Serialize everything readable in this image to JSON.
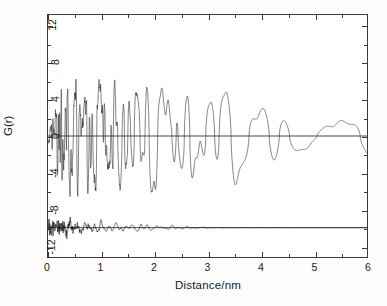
{
  "chart_data": {
    "type": "line",
    "title": "",
    "subtitle": "",
    "xlabel": "Distance/nm",
    "ylabel": "G(r)",
    "xlim": [
      0,
      6
    ],
    "ylim": [
      -13.2,
      13.2
    ],
    "xticks": [
      0,
      1,
      2,
      3,
      4,
      5,
      6
    ],
    "xticklabels": [
      "0",
      "1",
      "2",
      "3",
      "4",
      "5",
      "6"
    ],
    "xminor_step": 0.5,
    "yticks": [
      -12,
      -8,
      -4,
      0,
      4,
      8,
      12
    ],
    "yticklabels": [
      "-12",
      "-8",
      "-4",
      "0",
      "4",
      "8",
      "12"
    ],
    "yminor_step": 2,
    "grid": false,
    "legend": null,
    "annotations": [],
    "reference_lines": [
      {
        "name": "zero-line",
        "y": 0,
        "color": "#1a1a1a"
      },
      {
        "name": "difference-offset-line",
        "y": -10.0,
        "color": "#1a1a1a"
      }
    ],
    "series": [
      {
        "name": "G(r) experimental/model overlay",
        "color": "#333333",
        "linewidth": 0.6,
        "offset": 0,
        "description": "high-frequency PDF oscillating about 0, amplitude decaying from ~12.5 near r=0.3 nm to ~3 at r=6 nm",
        "x_start": 0.0,
        "x_end": 6.0,
        "n_points": 1200,
        "envelope": [
          {
            "x": 0.0,
            "amp": 2.2
          },
          {
            "x": 0.25,
            "amp": 10.0
          },
          {
            "x": 0.4,
            "amp": 12.6
          },
          {
            "x": 0.7,
            "amp": 10.4
          },
          {
            "x": 1.05,
            "amp": 12.5
          },
          {
            "x": 1.45,
            "amp": 11.6
          },
          {
            "x": 1.8,
            "amp": 9.0
          },
          {
            "x": 2.2,
            "amp": 10.0
          },
          {
            "x": 2.45,
            "amp": 11.4
          },
          {
            "x": 2.9,
            "amp": 7.6
          },
          {
            "x": 3.3,
            "amp": 9.3
          },
          {
            "x": 3.6,
            "amp": 6.8
          },
          {
            "x": 4.0,
            "amp": 4.4
          },
          {
            "x": 4.6,
            "amp": 3.8
          },
          {
            "x": 5.0,
            "amp": 4.2
          },
          {
            "x": 5.5,
            "amp": 3.3
          },
          {
            "x": 6.0,
            "amp": 3.2
          }
        ]
      },
      {
        "name": "difference curve",
        "color": "#1a1a1a",
        "linewidth": 0.6,
        "offset": -10.0,
        "description": "residual curve offset to -10; large noise below 0.6 nm reaching -12.5, damping to a flat line beyond ~2.7 nm",
        "x_start": 0.0,
        "x_end": 6.0,
        "n_points": 1200,
        "envelope": [
          {
            "x": 0.0,
            "amp": 1.9
          },
          {
            "x": 0.2,
            "amp": 2.3
          },
          {
            "x": 0.35,
            "amp": 2.6
          },
          {
            "x": 0.5,
            "amp": 2.4
          },
          {
            "x": 0.8,
            "amp": 1.5
          },
          {
            "x": 1.2,
            "amp": 1.0
          },
          {
            "x": 1.6,
            "amp": 0.75
          },
          {
            "x": 2.0,
            "amp": 0.5
          },
          {
            "x": 2.4,
            "amp": 0.3
          },
          {
            "x": 2.7,
            "amp": 0.12
          },
          {
            "x": 3.2,
            "amp": 0.02
          },
          {
            "x": 6.0,
            "amp": 0.0
          }
        ]
      }
    ]
  },
  "axes": {
    "x_title": "Distance/nm",
    "y_title": "G(r)",
    "x_tick_labels": [
      "0",
      "1",
      "2",
      "3",
      "4",
      "5",
      "6"
    ],
    "y_tick_labels": [
      "-12",
      "-8",
      "-4",
      "0",
      "4",
      "8",
      "12"
    ]
  },
  "colors": {
    "frame": "#3a3a3a",
    "curve_upper": "#333333",
    "curve_lower": "#1a1a1a",
    "background": "#ffffff",
    "text": "#1a1a1a"
  }
}
